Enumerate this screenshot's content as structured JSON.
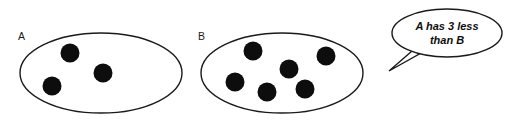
{
  "canvas": {
    "width": 509,
    "height": 130,
    "background": "#ffffff",
    "stroke_color": "#1a1a1a",
    "dot_color": "#0d0d0d"
  },
  "sets": [
    {
      "id": "set-a",
      "label": "A",
      "label_x": 18,
      "label_y": 40,
      "ellipse": {
        "cx": 101,
        "cy": 73,
        "rx": 81,
        "ry": 40
      },
      "count": 3,
      "dots": [
        {
          "cx": 70,
          "cy": 53,
          "r": 9.5
        },
        {
          "cx": 103,
          "cy": 73,
          "r": 9.5
        },
        {
          "cx": 52,
          "cy": 86,
          "r": 9.5
        }
      ]
    },
    {
      "id": "set-b",
      "label": "B",
      "label_x": 198,
      "label_y": 40,
      "ellipse": {
        "cx": 282,
        "cy": 73,
        "rx": 81,
        "ry": 40
      },
      "count": 6,
      "dots": [
        {
          "cx": 253,
          "cy": 51,
          "r": 9.5
        },
        {
          "cx": 326,
          "cy": 56,
          "r": 9.5
        },
        {
          "cx": 289,
          "cy": 69,
          "r": 9.5
        },
        {
          "cx": 235,
          "cy": 82,
          "r": 9.5
        },
        {
          "cx": 267,
          "cy": 92,
          "r": 9.5
        },
        {
          "cx": 305,
          "cy": 89,
          "r": 9.5
        }
      ]
    }
  ],
  "speech_bubble": {
    "ellipse": {
      "cx": 447,
      "cy": 33,
      "rx": 55,
      "ry": 24
    },
    "tail_points": "412,51 389,71 421,53",
    "lines": [
      {
        "text": "A has 3 less",
        "x": 447,
        "y": 30
      },
      {
        "text": "than B",
        "x": 447,
        "y": 44
      }
    ],
    "full_text": "A has 3 less than B"
  }
}
